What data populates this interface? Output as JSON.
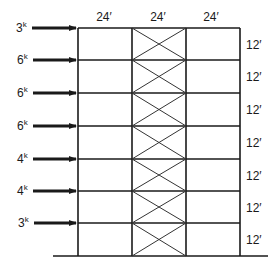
{
  "diagram": {
    "type": "braced-frame-elevation",
    "bay_widths": [
      "24′",
      "24′",
      "24′"
    ],
    "story_heights": [
      "12′",
      "12′",
      "12′",
      "12′",
      "12′",
      "12′",
      "12′"
    ],
    "lateral_loads": [
      {
        "value": "3",
        "unit": "k"
      },
      {
        "value": "6",
        "unit": "k"
      },
      {
        "value": "6",
        "unit": "k"
      },
      {
        "value": "6",
        "unit": "k"
      },
      {
        "value": "4",
        "unit": "k"
      },
      {
        "value": "4",
        "unit": "k"
      },
      {
        "value": "3",
        "unit": "k"
      }
    ],
    "braced_bay": "middle",
    "bracing": "X-bracing"
  },
  "colors": {
    "line": "#1a1a1a",
    "background": "#ffffff"
  }
}
